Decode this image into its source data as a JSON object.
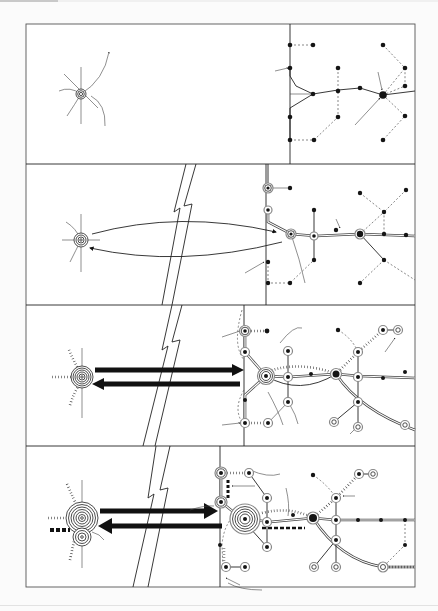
{
  "figure": {
    "panels": [
      {
        "id": 1,
        "stage": "isolated core with radiating routes; separate dotted network with single main route"
      },
      {
        "id": 2,
        "stage": "thin two-way curved arrows linking core and network across a break"
      },
      {
        "id": 3,
        "stage": "thick two-way arrows; network nodes gain rings and tick-marked routes"
      },
      {
        "id": 4,
        "stage": "very thick arrows; core doubled, network densified with large central node"
      }
    ],
    "colors": {
      "ink": "#222222",
      "paper": "#ffffff",
      "background": "#fbfbfb",
      "frame": "#555555"
    },
    "labels": []
  }
}
